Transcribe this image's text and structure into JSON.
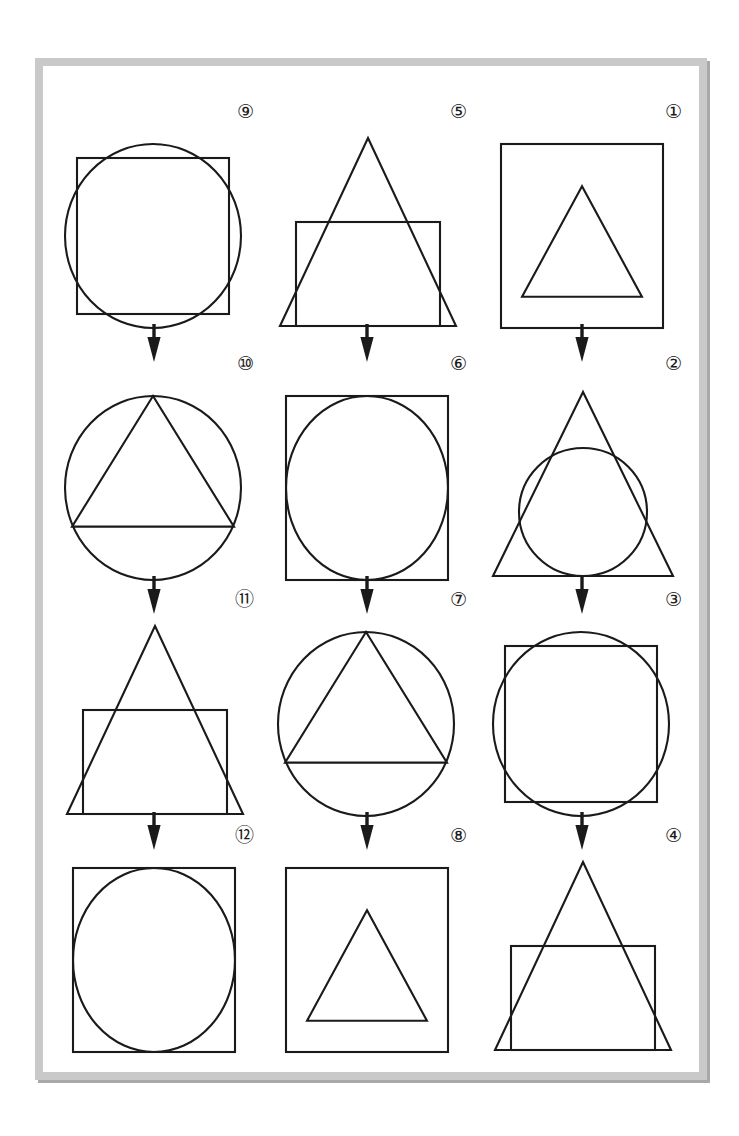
{
  "page": {
    "frame_color": "#c9c9c9",
    "ink_color": "#1a1a1a",
    "background": "#ffffff"
  },
  "arrow": {
    "name": "down-arrow",
    "glyph": "↓",
    "count": 9
  },
  "columns": [
    {
      "index": 0,
      "cell_ids": [
        "fig-9",
        "fig-10",
        "fig-11",
        "fig-12"
      ]
    },
    {
      "index": 1,
      "cell_ids": [
        "fig-5",
        "fig-6",
        "fig-7",
        "fig-8"
      ]
    },
    {
      "index": 2,
      "cell_ids": [
        "fig-1",
        "fig-2",
        "fig-3",
        "fig-4"
      ]
    }
  ],
  "figures": [
    {
      "id": "fig-9",
      "label": "⑨",
      "number": 9,
      "row": 0,
      "col": 0,
      "outer": "circle",
      "inner": "square",
      "description": "circle with inscribed square"
    },
    {
      "id": "fig-5",
      "label": "⑤",
      "number": 5,
      "row": 0,
      "col": 1,
      "outer": "triangle",
      "inner": "square",
      "description": "triangle with square on base"
    },
    {
      "id": "fig-1",
      "label": "①",
      "number": 1,
      "row": 0,
      "col": 2,
      "outer": "square",
      "inner": "triangle",
      "description": "square containing triangle"
    },
    {
      "id": "fig-10",
      "label": "⑩",
      "number": 10,
      "row": 1,
      "col": 0,
      "outer": "circle",
      "inner": "triangle",
      "description": "circle with inscribed triangle"
    },
    {
      "id": "fig-6",
      "label": "⑥",
      "number": 6,
      "row": 1,
      "col": 1,
      "outer": "square",
      "inner": "circle",
      "description": "square with inscribed circle"
    },
    {
      "id": "fig-2",
      "label": "②",
      "number": 2,
      "row": 1,
      "col": 2,
      "outer": "triangle",
      "inner": "circle",
      "description": "triangle with inscribed circle"
    },
    {
      "id": "fig-11",
      "label": "⑪",
      "number": 11,
      "row": 2,
      "col": 0,
      "outer": "triangle",
      "inner": "square",
      "description": "triangle with square on base"
    },
    {
      "id": "fig-7",
      "label": "⑦",
      "number": 7,
      "row": 2,
      "col": 1,
      "outer": "circle",
      "inner": "triangle",
      "description": "circle with inscribed triangle"
    },
    {
      "id": "fig-3",
      "label": "③",
      "number": 3,
      "row": 2,
      "col": 2,
      "outer": "circle",
      "inner": "square",
      "description": "circle with inscribed square"
    },
    {
      "id": "fig-12",
      "label": "⑫",
      "number": 12,
      "row": 3,
      "col": 0,
      "outer": "square",
      "inner": "circle",
      "description": "square with inscribed circle"
    },
    {
      "id": "fig-8",
      "label": "⑧",
      "number": 8,
      "row": 3,
      "col": 1,
      "outer": "square",
      "inner": "triangle",
      "description": "square containing triangle"
    },
    {
      "id": "fig-4",
      "label": "④",
      "number": 4,
      "row": 3,
      "col": 2,
      "outer": "triangle",
      "inner": "square",
      "description": "triangle with square on base"
    }
  ]
}
